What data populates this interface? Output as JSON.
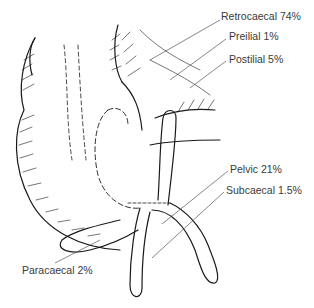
{
  "diagram": {
    "labels": [
      {
        "id": "retrocaecal",
        "text": "Retrocaecal 74%",
        "x": 221,
        "y": 16
      },
      {
        "id": "preilial",
        "text": "Preilial 1%",
        "x": 229,
        "y": 35
      },
      {
        "id": "postilial",
        "text": "Postilial 5%",
        "x": 229,
        "y": 57
      },
      {
        "id": "pelvic",
        "text": "Pelvic 21%",
        "x": 230,
        "y": 168
      },
      {
        "id": "subcaecal",
        "text": "Subcaecal 1.5%",
        "x": 226,
        "y": 189
      },
      {
        "id": "paracaecal",
        "text": "Paracaecal 2%",
        "x": 22,
        "y": 268
      }
    ],
    "colors": {
      "line": "#1a1a1a",
      "leader": "#555555",
      "text": "#3a3a3a"
    }
  }
}
